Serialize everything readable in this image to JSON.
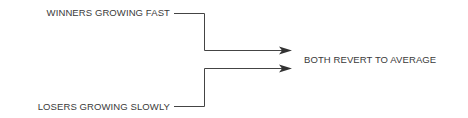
{
  "diagram": {
    "inputs": [
      {
        "label": "WINNERS GROWING FAST"
      },
      {
        "label": "LOSERS GROWING SLOWLY"
      }
    ],
    "output": {
      "label": "BOTH REVERT TO AVERAGE"
    },
    "line_color": "#444444",
    "text_color": "#3a3a3a"
  }
}
